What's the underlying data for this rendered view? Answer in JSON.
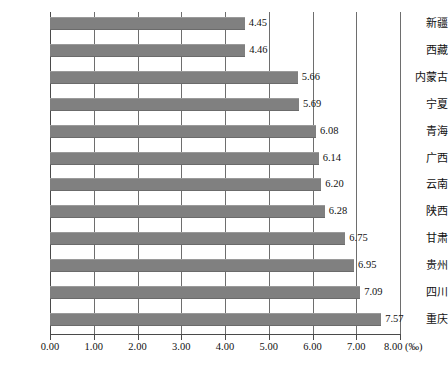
{
  "chart_data": {
    "type": "bar",
    "orientation": "horizontal",
    "title": "",
    "subtitle": "",
    "xlabel": "",
    "ylabel": "",
    "unit": "‰",
    "unit_label": "8.00 (‰)",
    "xlim": [
      0.0,
      8.0
    ],
    "xtick_step": 1.0,
    "grid": "vertical",
    "legend": "none",
    "bar_color": "#808080",
    "axis_color": "#4a4a4a",
    "gridline_color": "#6e6e6e",
    "categories": [
      "新疆",
      "西藏",
      "内蒙古",
      "宁夏",
      "青海",
      "广西",
      "云南",
      "陕西",
      "甘肃",
      "贵州",
      "四川",
      "重庆"
    ],
    "values": [
      4.45,
      4.46,
      5.66,
      5.69,
      6.08,
      6.14,
      6.2,
      6.28,
      6.75,
      6.95,
      7.09,
      7.57
    ],
    "value_labels": [
      "4.45",
      "4.46",
      "5.66",
      "5.69",
      "6.08",
      "6.14",
      "6.20",
      "6.28",
      "6.75",
      "6.95",
      "7.09",
      "7.57"
    ],
    "xticks": [
      0.0,
      1.0,
      2.0,
      3.0,
      4.0,
      5.0,
      6.0,
      7.0,
      8.0
    ],
    "xtick_labels": [
      "0.00",
      "1.00",
      "2.00",
      "3.00",
      "4.00",
      "5.00",
      "6.00",
      "7.00",
      "8.00 (‰)"
    ]
  },
  "caption": ""
}
